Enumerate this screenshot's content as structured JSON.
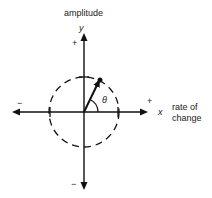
{
  "diagram": {
    "labels": {
      "y_axis_title": "amplitude",
      "y_axis_symbol": "y",
      "y_positive": "+",
      "y_negative": "−",
      "x_axis_title_line1": "rate of",
      "x_axis_title_line2": "change",
      "x_axis_symbol": "x",
      "x_positive": "+",
      "x_negative": "−",
      "angle_symbol": "θ"
    },
    "colors": {
      "ink": "#111111",
      "background": "#ffffff"
    }
  }
}
